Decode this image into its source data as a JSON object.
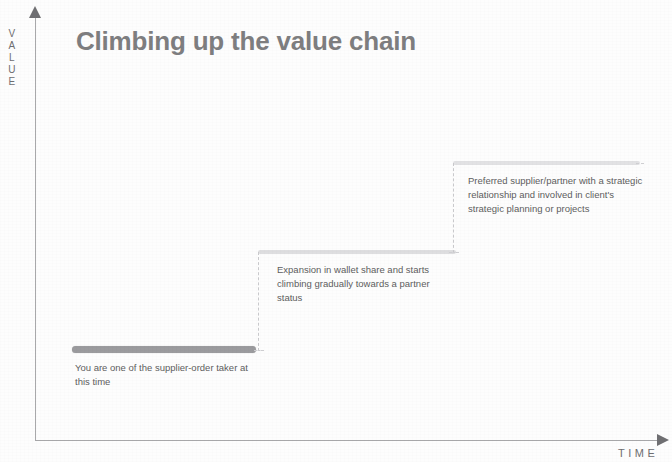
{
  "slide": {
    "title": "Climbing up the value chain",
    "title_color": "#7e7e80",
    "background_color": "#fdfdfd"
  },
  "axes": {
    "y_label": "VALUE",
    "y_label_letters": [
      "V",
      "A",
      "L",
      "U",
      "E"
    ],
    "x_label": "TIME",
    "axis_color": "#a9a9ab",
    "arrow_color": "#6f6f72"
  },
  "chart_data": {
    "type": "bar",
    "title": "Climbing up the value chain",
    "subtitle": "",
    "xlabel": "TIME",
    "ylabel": "VALUE",
    "grid": false,
    "legend": "none",
    "axis_style": "arrows",
    "step_shape": "staircase",
    "categories": [
      "Stage 1",
      "Stage 2",
      "Stage 3"
    ],
    "values": [
      1,
      2,
      3
    ],
    "xlim": [
      0,
      3
    ],
    "ylim": [
      0,
      3
    ],
    "annotations": [
      "You are one of the supplier-order taker at this time",
      "Expansion in wallet share and starts climbing gradually towards a partner status",
      "Preferred supplier/partner with a strategic relationship and involved in client's strategic planning or projects"
    ]
  },
  "steps": [
    {
      "id": "step-1",
      "level": 1,
      "tread_color": "#9b9b9e",
      "caption": "You are one of the supplier-order taker at this time"
    },
    {
      "id": "step-2",
      "level": 2,
      "tread_color": "#dedee0",
      "caption": "Expansion in wallet share and starts climbing gradually towards a partner status"
    },
    {
      "id": "step-3",
      "level": 3,
      "tread_color": "#e2e2e4",
      "caption": "Preferred supplier/partner with a strategic relationship and involved in client's strategic planning or projects"
    }
  ]
}
